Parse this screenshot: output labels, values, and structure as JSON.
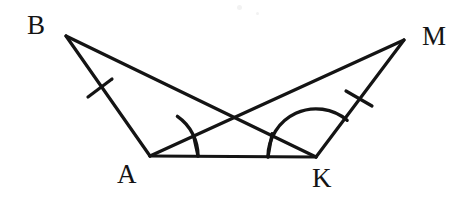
{
  "figure": {
    "background_color": "#ffffff",
    "stroke_color": "#141414",
    "width": 469,
    "height": 208
  },
  "labels": {
    "B": "B",
    "M": "M",
    "A": "A",
    "K": "K"
  },
  "points": {
    "B": {
      "name": "B",
      "x": 66,
      "y": 36
    },
    "M": {
      "name": "M",
      "x": 404,
      "y": 40
    },
    "A": {
      "name": "A",
      "x": 150,
      "y": 156
    },
    "K": {
      "name": "K",
      "x": 316,
      "y": 157
    },
    "X": {
      "name": "intersection",
      "x": 233,
      "y": 117
    }
  },
  "segments": [
    {
      "name": "BA",
      "from": "B",
      "to": "A",
      "tick_marks": 1
    },
    {
      "name": "AK",
      "from": "A",
      "to": "K",
      "tick_marks": 0
    },
    {
      "name": "KM",
      "from": "K",
      "to": "M",
      "tick_marks": 1
    },
    {
      "name": "BM",
      "from": "B",
      "to": "M",
      "tick_marks": 0
    },
    {
      "name": "AM",
      "from": "A",
      "to": "M",
      "tick_marks": 0
    }
  ],
  "angle_marks": [
    {
      "name": "angle-BAK",
      "vertex": "A",
      "from_ray": "AB",
      "to_ray": "AK",
      "arcs": 1,
      "radius": 48
    },
    {
      "name": "angle-MKA",
      "vertex": "K",
      "from_ray": "KM",
      "to_ray": "KA",
      "arcs": 1,
      "radius": 48
    }
  ],
  "tick_marks": [
    {
      "name": "tick-BA",
      "segment": "BA",
      "x": 100,
      "y": 88
    },
    {
      "name": "tick-KM",
      "segment": "KM",
      "x": 359,
      "y": 98
    }
  ],
  "inner_ticks": [
    {
      "name": "inner-tick-A",
      "vertex": "A",
      "along": "AM"
    },
    {
      "name": "inner-tick-K",
      "vertex": "K",
      "along": "KB"
    }
  ],
  "specks": [
    {
      "name": "speck-1",
      "x": 237,
      "y": 5,
      "size": 5
    },
    {
      "name": "speck-2",
      "x": 256,
      "y": 12,
      "size": 3
    }
  ]
}
